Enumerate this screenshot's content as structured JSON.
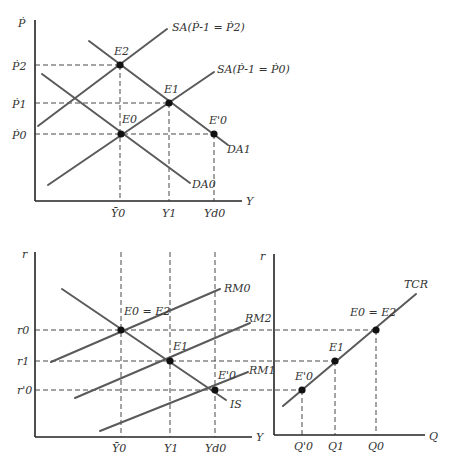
{
  "diagram": {
    "top_panel": {
      "y_axis_label": "Ṗ",
      "x_axis_label": "Y",
      "y_ticks": [
        "Ṗ2",
        "Ṗ1",
        "Ṗ0"
      ],
      "x_ticks": [
        "Ȳ0",
        "Y1",
        "Yd0"
      ],
      "curves": {
        "sa_high": "SA(Ṗ-1 = Ṗ2)",
        "sa_low": "SA(Ṗ-1 = Ṗ0)",
        "da1": "DA1",
        "da0": "DA0"
      },
      "points": {
        "e2": "E2",
        "e1": "E1",
        "e0": "E0",
        "e0_prime": "E'0"
      }
    },
    "bottom_left_panel": {
      "y_axis_label": "r",
      "x_axis_label": "Y",
      "y_ticks": [
        "r0",
        "r1",
        "r'0"
      ],
      "x_ticks": [
        "Ȳ0",
        "Y1",
        "Yd0"
      ],
      "curves": {
        "rm0": "RM0",
        "rm2": "RM2",
        "rm1": "RM1",
        "is": "IS"
      },
      "points": {
        "e0_e2": "E0 = E2",
        "e1": "E1",
        "e0_prime": "E'0"
      }
    },
    "bottom_right_panel": {
      "y_axis_label": "r",
      "x_axis_label": "Q",
      "x_ticks": [
        "Q'0",
        "Q1",
        "Q0"
      ],
      "curves": {
        "tcr": "TCR"
      },
      "points": {
        "e0_e2": "E0 = E2",
        "e1": "E1",
        "e0_prime": "E'0"
      }
    }
  }
}
